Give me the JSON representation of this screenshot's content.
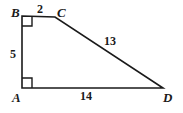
{
  "figure": {
    "background_color": "#ffffff",
    "stroke_color": "#1a1a1a",
    "vertices": [
      {
        "name": "B",
        "label": "B",
        "x": 22,
        "y": 16
      },
      {
        "name": "C",
        "label": "C",
        "x": 55,
        "y": 17
      },
      {
        "name": "D",
        "label": "D",
        "x": 163,
        "y": 88
      },
      {
        "name": "A",
        "label": "A",
        "x": 22,
        "y": 88
      }
    ],
    "sides": [
      {
        "name": "BC",
        "label": "2",
        "from": "B",
        "to": "C"
      },
      {
        "name": "CD",
        "label": "13",
        "from": "C",
        "to": "D"
      },
      {
        "name": "AD",
        "label": "14",
        "from": "A",
        "to": "D"
      },
      {
        "name": "AB",
        "label": "5",
        "from": "A",
        "to": "B"
      }
    ],
    "right_angles": [
      {
        "name": "right-angle-at-B",
        "vertex": "B"
      },
      {
        "name": "right-angle-at-A",
        "vertex": "A"
      }
    ]
  }
}
